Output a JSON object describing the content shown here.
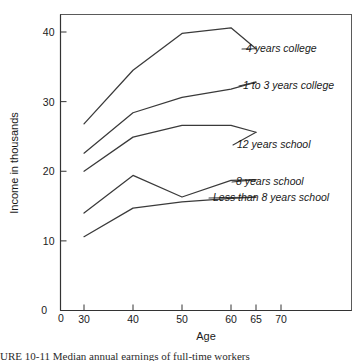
{
  "figure": {
    "y_axis_title": "Income in thousands",
    "x_axis_title": "Age",
    "origin_x_label": "0",
    "origin_y_label": "0",
    "caption": "URE 10-11  Median annual earnings of full-time workers"
  },
  "chart_data": {
    "type": "line",
    "title": "",
    "xlabel": "Age",
    "ylabel": "Income in thousands",
    "x": [
      30,
      40,
      50,
      60,
      65
    ],
    "xlim": [
      0,
      70
    ],
    "ylim": [
      0,
      42
    ],
    "xticks": [
      0,
      30,
      40,
      50,
      60,
      65,
      70
    ],
    "xtick_labels": [
      "0",
      "30",
      "40",
      "50",
      "60",
      "65",
      "70"
    ],
    "yticks": [
      0,
      10,
      20,
      30,
      40
    ],
    "ytick_labels": [
      "0",
      "10",
      "20",
      "30",
      "40"
    ],
    "grid": false,
    "legend_position": "inline-right",
    "series": [
      {
        "name": "4 years college",
        "label": "4 years college",
        "values": [
          26.8,
          34.5,
          39.8,
          40.6,
          37.6
        ]
      },
      {
        "name": "1 to 3 years college",
        "label": "1 to 3 years college",
        "values": [
          22.6,
          28.4,
          30.6,
          31.8,
          32.8
        ]
      },
      {
        "name": "12 years school",
        "label": "12 years school",
        "values": [
          20.0,
          24.9,
          26.6,
          26.6,
          25.6
        ]
      },
      {
        "name": "8 years school",
        "label": "8 years school",
        "values": [
          14.0,
          19.4,
          16.3,
          18.7,
          18.8
        ]
      },
      {
        "name": "Less than 8 years school",
        "label": "Less than 8 years school",
        "values": [
          10.6,
          14.7,
          15.6,
          16.1,
          16.3
        ]
      }
    ]
  }
}
